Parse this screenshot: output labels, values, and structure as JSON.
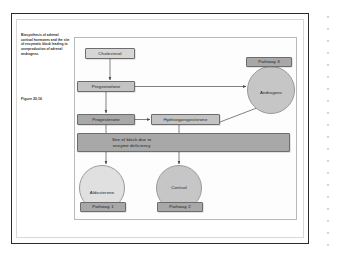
{
  "figure": {
    "caption": "Biosynthesis of adrenal cortical hormones and the site of enzymatic block leading to overproduction of adrenal androgens.",
    "number": "Figure 20.16"
  },
  "diagram": {
    "nodes": {
      "cholesterol": "Cholesterol",
      "pregnenolone": "Pregnenolone",
      "progesterone": "Progesterone",
      "hydroxyprogesterone": "Hydroxyprogesterone",
      "block_band": "Site of block due to\nenzyme deficiency",
      "aldosterone": "Aldosterone",
      "cortisol": "Cortisol",
      "androgens": "Androgens",
      "pathway1": "Pathway 1",
      "pathway2": "Pathway 2",
      "pathway3": "Pathway 3"
    },
    "colors": {
      "box_light": "#d6d6d6",
      "box_mid": "#c3c3c3",
      "box_dark": "#a8a8a8",
      "band": "#a8a8a8",
      "circle_light": "#e0e0e0",
      "circle_mid": "#c6c6c6",
      "outline": "#6d6d6d",
      "frame": "#2b2b2b",
      "arrow": "#4a4a4a"
    },
    "edges": [
      {
        "from": "cholesterol",
        "to": "pregnenolone",
        "style": "vertical-arrow"
      },
      {
        "from": "pregnenolone",
        "to": "progesterone",
        "style": "vertical-arrow"
      },
      {
        "from": "pregnenolone",
        "to": "androgens",
        "style": "horizontal-arrow"
      },
      {
        "from": "progesterone",
        "to": "hydroxyprogesterone",
        "style": "horizontal-arrow"
      },
      {
        "from": "hydroxyprogesterone",
        "to": "androgens",
        "style": "diagonal-arrow"
      },
      {
        "from": "progesterone",
        "to": "aldosterone",
        "style": "vertical-arrow-through-band"
      },
      {
        "from": "hydroxyprogesterone",
        "to": "cortisol",
        "style": "vertical-arrow-through-band"
      }
    ]
  }
}
